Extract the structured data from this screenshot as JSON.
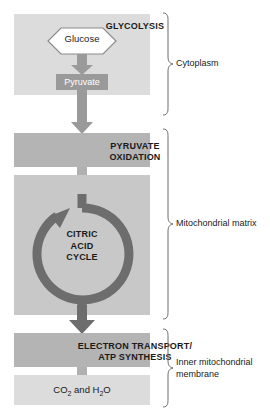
{
  "figure": {
    "type": "flow-diagram"
  },
  "stages": {
    "glycolysis": {
      "title": "GLYCOLYSIS",
      "substrate": "Glucose",
      "product": "Pyruvate"
    },
    "pyruvate_oxidation": {
      "title": "PYRUVATE\nOXIDATION",
      "line1": "PYRUVATE",
      "line2": "OXIDATION"
    },
    "citric_acid_cycle": {
      "title": "CITRIC\nACID\nCYCLE",
      "line1": "CITRIC",
      "line2": "ACID",
      "line3": "CYCLE"
    },
    "electron_transport": {
      "title": "ELECTRON TRANSPORT/\nATP SYNTHESIS",
      "line1": "ELECTRON TRANSPORT/",
      "line2": "ATP SYNTHESIS"
    },
    "products": {
      "text_before": "CO",
      "sub1": "2",
      "text_middle": " and H",
      "sub2": "2",
      "text_after": "O",
      "plain": "CO2 and H2O"
    }
  },
  "compartments": [
    {
      "id": "cytoplasm",
      "label": "Cytoplasm"
    },
    {
      "id": "mitochondrial-matrix",
      "label": "Mitochondrial matrix"
    },
    {
      "id": "inner-mitochondrial-membrane",
      "label": "Inner mitochondrial\nmembrane"
    }
  ],
  "colors": {
    "panel_light": "#dcdcdc",
    "panel_mid": "#c8c8c8",
    "panel_dark": "#b4b4b4",
    "pyruvate_fill": "#9a9a9a",
    "arrow_light": "#b0b0b0",
    "arrow_mid": "#9a9a9a",
    "cycle_arrow": "#6d6d6d",
    "outline": "#8a8a8a",
    "text": "#1a1a1a",
    "bracket": "#6b6b6b",
    "background": "#ffffff"
  }
}
